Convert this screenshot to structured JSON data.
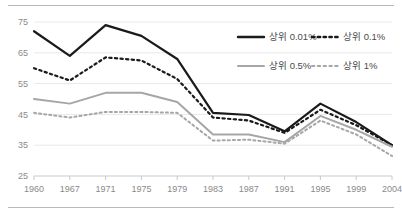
{
  "chart_data": {
    "type": "line",
    "title": "",
    "xlabel": "",
    "ylabel": "",
    "grid": true,
    "legend_position": "top-right",
    "categories": [
      "1960",
      "1967",
      "1971",
      "1975",
      "1979",
      "1983",
      "1987",
      "1991",
      "1995",
      "1999",
      "2004"
    ],
    "x": [
      1960,
      1967,
      1971,
      1975,
      1979,
      1983,
      1987,
      1991,
      1995,
      1999,
      2004
    ],
    "ylim": [
      25,
      75
    ],
    "yticks": [
      25,
      35,
      45,
      55,
      65,
      75
    ],
    "series": [
      {
        "name": "상위 0.01%",
        "color": "#1a1a1a",
        "style": "solid",
        "width": 2.2,
        "values": [
          72.0,
          64.0,
          74.0,
          70.5,
          63.0,
          45.5,
          44.8,
          39.5,
          48.5,
          42.5,
          35.0
        ]
      },
      {
        "name": "상위 0.1%",
        "color": "#1a1a1a",
        "style": "dotted",
        "width": 2.2,
        "values": [
          60.0,
          56.0,
          63.5,
          62.5,
          56.5,
          44.0,
          43.0,
          39.0,
          46.5,
          41.5,
          35.0
        ]
      },
      {
        "name": "상위 0.5%",
        "color": "#a6a6a6",
        "style": "solid",
        "width": 2.0,
        "values": [
          50.0,
          48.5,
          52.0,
          52.0,
          49.0,
          38.5,
          38.5,
          36.0,
          44.5,
          40.0,
          34.5
        ]
      },
      {
        "name": "상위 1%",
        "color": "#a6a6a6",
        "style": "dotted",
        "width": 2.0,
        "values": [
          45.5,
          44.0,
          45.8,
          45.8,
          45.5,
          36.5,
          36.8,
          35.5,
          43.0,
          38.5,
          31.5
        ]
      }
    ]
  },
  "legend": {
    "items": [
      {
        "label": "상위 0.01%",
        "color": "#1a1a1a",
        "style": "solid"
      },
      {
        "label": "상위 0.1%",
        "color": "#1a1a1a",
        "style": "dotted"
      },
      {
        "label": "상위 0.5%",
        "color": "#a6a6a6",
        "style": "solid"
      },
      {
        "label": "상위 1%",
        "color": "#a6a6a6",
        "style": "dotted"
      }
    ]
  }
}
